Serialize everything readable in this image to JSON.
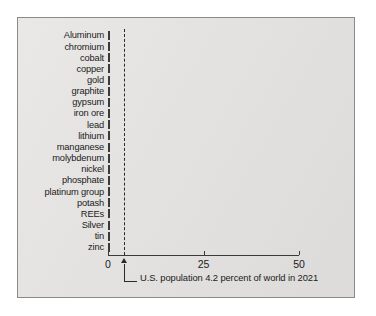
{
  "chart_data": {
    "type": "bar",
    "orientation": "horizontal",
    "title": "",
    "xlabel": "",
    "ylabel": "",
    "xlim": [
      0,
      54
    ],
    "grid": false,
    "legend": null,
    "categories": [
      "Aluminum",
      "chromium",
      "cobalt",
      "copper",
      "gold",
      "graphite",
      "gypsum",
      "iron ore",
      "lead",
      "lithium",
      "manganese",
      "molybdenum",
      "nickel",
      "phosphate",
      "platinum group",
      "potash",
      "REEs",
      "Silver",
      "tin",
      "zinc"
    ],
    "values": [
      6.5,
      0.5,
      4.0,
      8.0,
      7.0,
      4.5,
      29.0,
      1.0,
      36.5,
      2.0,
      3.0,
      43.0,
      6.5,
      10.5,
      33.0,
      16.0,
      1.5,
      33.0,
      15.0,
      6.0
    ],
    "xticks": [
      0,
      25,
      50
    ],
    "xtick_labels": [
      "0",
      "25",
      "50"
    ],
    "reference_line": {
      "value": 4.2,
      "style": "dashed",
      "label": "U.S. population 4.2 percent of world in 2021"
    },
    "annotations": [
      {
        "name": "us-population-note",
        "text": "U.S. population 4.2 percent of world in 2021"
      }
    ]
  },
  "colors": {
    "panel_background": "#e4e3e1",
    "panel_border": "#8a8a88",
    "bar_outline": "#3a3a3a",
    "bar_fill_dark": "#6f6f6f",
    "bar_fill_light": "#f2f2f2",
    "axis": "#3a3a3a",
    "text": "#1b1b1b"
  }
}
